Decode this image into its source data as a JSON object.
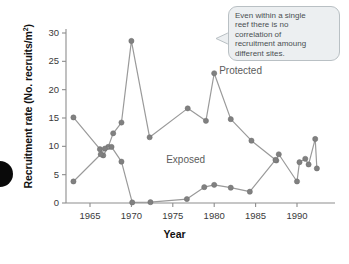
{
  "chart_data": {
    "type": "line",
    "title": "",
    "xlabel": "Year",
    "ylabel": "Recruitment rate (No. recruits/m2)",
    "ylabel_main": "Recruitment rate (No. recruits/m",
    "ylabel_sup": "2",
    "ylabel_tail": ")",
    "xlim": [
      1962,
      1993
    ],
    "ylim": [
      0,
      30
    ],
    "grid": false,
    "legend_position": "inline-annotation",
    "xticks": [
      1965,
      1970,
      1975,
      1980,
      1985,
      1990
    ],
    "yticks": [
      0,
      5,
      10,
      15,
      20,
      25,
      30
    ],
    "marker_color": "#808080",
    "line_color": "#9a9a9a",
    "series": [
      {
        "name": "Protected",
        "label_x": 1980.6,
        "label_y": 23.2,
        "points": [
          {
            "x": 1963.0,
            "y": 15.1
          },
          {
            "x": 1966.2,
            "y": 9.5
          },
          {
            "x": 1966.6,
            "y": 8.4
          },
          {
            "x": 1967.2,
            "y": 9.9
          },
          {
            "x": 1967.8,
            "y": 12.3
          },
          {
            "x": 1968.8,
            "y": 14.2
          },
          {
            "x": 1970.0,
            "y": 28.6
          },
          {
            "x": 1972.2,
            "y": 11.6
          },
          {
            "x": 1976.8,
            "y": 16.7
          },
          {
            "x": 1979.0,
            "y": 14.5
          },
          {
            "x": 1980.0,
            "y": 22.9
          },
          {
            "x": 1982.0,
            "y": 14.8
          },
          {
            "x": 1984.5,
            "y": 11.0
          },
          {
            "x": 1987.5,
            "y": 7.5
          },
          {
            "x": 1987.8,
            "y": 8.6
          },
          {
            "x": 1990.0,
            "y": 3.8
          },
          {
            "x": 1990.3,
            "y": 7.2
          },
          {
            "x": 1991.0,
            "y": 7.8
          },
          {
            "x": 1991.4,
            "y": 6.8
          },
          {
            "x": 1992.2,
            "y": 11.3
          },
          {
            "x": 1992.4,
            "y": 6.1
          }
        ]
      },
      {
        "name": "Exposed",
        "label_x": 1974.2,
        "label_y": 7.4,
        "points": [
          {
            "x": 1963.0,
            "y": 3.8
          },
          {
            "x": 1966.3,
            "y": 8.6
          },
          {
            "x": 1966.8,
            "y": 9.6
          },
          {
            "x": 1967.6,
            "y": 9.9
          },
          {
            "x": 1968.8,
            "y": 7.3
          },
          {
            "x": 1970.1,
            "y": 0.1
          },
          {
            "x": 1972.3,
            "y": 0.15
          },
          {
            "x": 1976.7,
            "y": 0.7
          },
          {
            "x": 1978.8,
            "y": 2.8
          },
          {
            "x": 1980.0,
            "y": 3.2
          },
          {
            "x": 1982.0,
            "y": 2.7
          },
          {
            "x": 1984.3,
            "y": 2.0
          },
          {
            "x": 1987.4,
            "y": 7.6
          }
        ]
      }
    ]
  },
  "annotation": {
    "name": "callout-note",
    "lines": [
      "Even within a single",
      "reef there is no",
      "correlation of",
      "recruitment amoung",
      "different sites."
    ],
    "text": "Even within a single reef there is no correlation of recruitment amoung different sites."
  }
}
